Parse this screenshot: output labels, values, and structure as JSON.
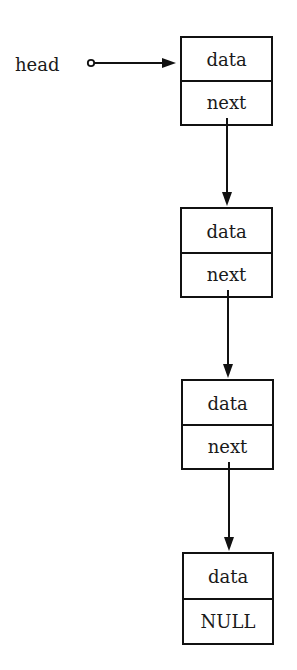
{
  "diagram": {
    "type": "singly-linked-list",
    "head_label": "head",
    "nodes": [
      {
        "field_top": "data",
        "field_bottom": "next"
      },
      {
        "field_top": "data",
        "field_bottom": "next"
      },
      {
        "field_top": "data",
        "field_bottom": "next"
      },
      {
        "field_top": "data",
        "field_bottom": "NULL"
      }
    ],
    "edges": [
      {
        "from": "head",
        "to": "node-0"
      },
      {
        "from": "node-0.next",
        "to": "node-1"
      },
      {
        "from": "node-1.next",
        "to": "node-2"
      },
      {
        "from": "node-2.next",
        "to": "node-3"
      }
    ],
    "colors": {
      "stroke": "#111111",
      "text": "#1a1a1a",
      "background": "#ffffff"
    }
  }
}
